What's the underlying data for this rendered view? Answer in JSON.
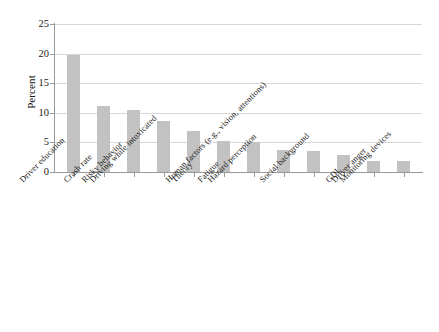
{
  "chart_data": {
    "type": "bar",
    "title": "",
    "subtitle": "",
    "xlabel": "",
    "ylabel": "Percent",
    "ylim": [
      0,
      25
    ],
    "yticks": [
      0,
      5,
      10,
      15,
      20,
      25
    ],
    "ytick_labels": [
      "0",
      "5",
      "10",
      "15",
      "20",
      "25"
    ],
    "grid": true,
    "grid_axis": "y",
    "legend": null,
    "bar_color": "#c2c2c2",
    "categories": [
      "Driver education",
      "Crash rate",
      "Risky behavior",
      "Driving while intoxicated",
      "Theory",
      "Fatigue",
      "Hazard perception",
      "Human factors (e.g., vision, attentions)",
      "Social background",
      "GDL",
      "Driver anger",
      "Monitoring devices"
    ],
    "values": [
      19.8,
      11.2,
      10.4,
      8.6,
      6.9,
      5.3,
      5.1,
      3.7,
      3.6,
      2.8,
      1.8,
      1.9
    ],
    "value_unit": "percent"
  },
  "axes": {
    "y_axis_label": "Percent",
    "y_tick_labels": [
      "25",
      "20",
      "15",
      "10",
      "5",
      "0"
    ]
  },
  "categories_labels": [
    "Driver education",
    "Crash rate",
    "Risky behavior",
    "Driving while intoxicated",
    "Theory",
    "Fatigue",
    "Hazard perception",
    "Human factors (e.g., vision, attentions)",
    "Social background",
    "GDL",
    "Driver anger",
    "Monitoring devices"
  ]
}
